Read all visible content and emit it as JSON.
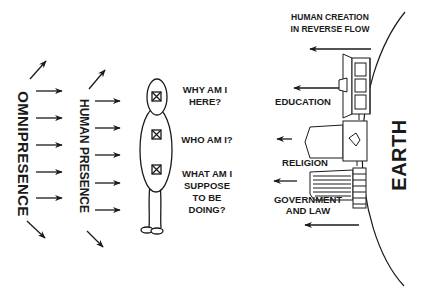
{
  "diagram": {
    "left_labels": {
      "omnipresence": "OMNIPRESENCE",
      "human_presence": "HUMAN PRESENCE"
    },
    "questions": [
      [
        "WHY AM I",
        "HERE?"
      ],
      [
        "WHO AM I?"
      ],
      [
        "WHAT AM I",
        "SUPPOSE",
        "TO BE",
        "DOING?"
      ]
    ],
    "right_header": [
      "HUMAN CREATION",
      "IN REVERSE FLOW"
    ],
    "institutions": [
      {
        "label": [
          "EDUCATION"
        ]
      },
      {
        "label": [
          "RELIGION"
        ]
      },
      {
        "label": [
          "GOVERNMENT",
          "AND LAW"
        ]
      }
    ],
    "earth_label": "EARTH",
    "colors": {
      "ink": "#1a1a1a",
      "background": "#ffffff"
    }
  }
}
